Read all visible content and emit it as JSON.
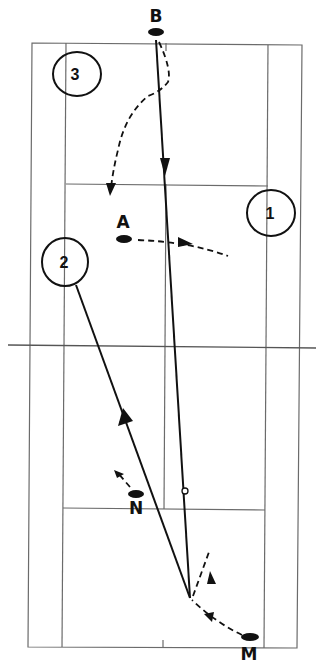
{
  "diagram": {
    "type": "badminton-doubles-court-rally",
    "colors": {
      "ink": "#111111",
      "court_line": "#6b6b6b",
      "background": "#ffffff"
    },
    "players": [
      {
        "id": "B",
        "label": "B",
        "x": 156,
        "y": 32
      },
      {
        "id": "A",
        "label": "A",
        "x": 124,
        "y": 239
      },
      {
        "id": "N",
        "label": "N",
        "x": 136,
        "y": 494
      },
      {
        "id": "M",
        "label": "M",
        "x": 250,
        "y": 637
      }
    ],
    "positions": [
      {
        "id": "3",
        "label": "3",
        "cx": 77,
        "cy": 74
      },
      {
        "id": "1",
        "label": "1",
        "cx": 271,
        "cy": 213
      },
      {
        "id": "2",
        "label": "2",
        "cx": 65,
        "cy": 262
      }
    ],
    "shots": [
      {
        "from": "M-area",
        "to": "B",
        "style": "solid",
        "arrow": "down-at-165"
      },
      {
        "from": "position-2",
        "to": "M-area",
        "style": "solid",
        "arrow": "up"
      }
    ],
    "movements": [
      {
        "player": "B",
        "style": "dashed",
        "toward": "front-left"
      },
      {
        "player": "A",
        "style": "dashed",
        "toward": "right"
      },
      {
        "player": "N",
        "style": "dashed",
        "toward": "back-left"
      },
      {
        "player": "M",
        "style": "dashed",
        "toward": "forward"
      }
    ]
  }
}
